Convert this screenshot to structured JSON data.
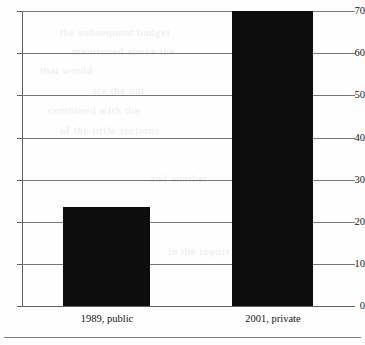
{
  "chart_data": {
    "type": "bar",
    "title": "",
    "subtitle": "",
    "xlabel": "",
    "ylabel": "",
    "categories": [
      "1989, public",
      "2001, private"
    ],
    "values": [
      23.5,
      70
    ],
    "series": [
      {
        "name": "",
        "values": [
          23.5,
          70
        ]
      }
    ],
    "ylim": [
      0,
      70
    ],
    "yticks": [
      0,
      10,
      20,
      30,
      40,
      50,
      60,
      70
    ],
    "ytick_labels": [
      "0",
      "10",
      "20",
      "30",
      "40",
      "50",
      "60",
      "70"
    ],
    "grid": "horizontal",
    "legend": "none",
    "bar_color": "#0d0d0d",
    "axis_color": "#5f6063",
    "grid_color": "#77787b",
    "background": "#fefefe"
  },
  "axis": {
    "y_labels": [
      "70",
      "60",
      "50",
      "40",
      "30",
      "20",
      "10",
      "0"
    ],
    "x_labels": [
      "1989, public",
      "2001, private"
    ]
  },
  "artifacts": {
    "ghost_lines": [
      "the subsequent budget",
      "mentioned above the",
      "that would",
      "are the not",
      "combined with the",
      "of the little sections",
      "and another",
      "in the report"
    ]
  }
}
